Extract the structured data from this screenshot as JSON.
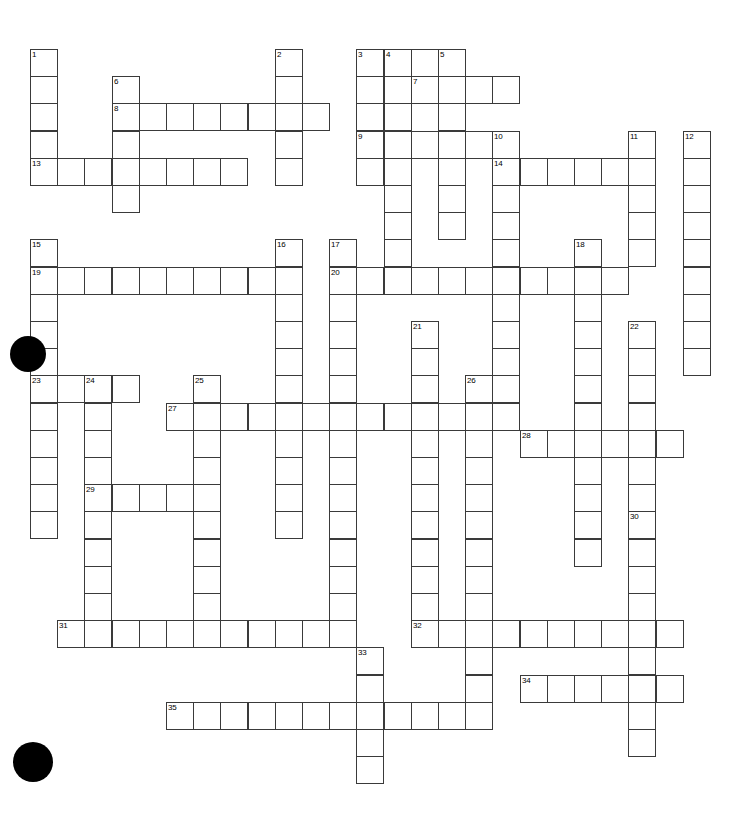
{
  "document": {
    "type": "crossword-puzzle-grid",
    "title": "Crossword Puzzle",
    "background_color": "#ffffff",
    "grid_line_color": "#3a3a3a",
    "cell_fill_color": "#ffffff",
    "marker_color": "#000000",
    "canvas": {
      "width": 738,
      "height": 814
    }
  },
  "grid": {
    "origin_x": 30,
    "origin_y": 49,
    "cell_size": 27.2,
    "columns": 25,
    "rows": 27,
    "number_count": 35
  },
  "markers": [
    {
      "name": "bullet-marker-left-middle",
      "cx": 28,
      "cy": 354,
      "r": 18
    },
    {
      "name": "bullet-marker-bottom-left",
      "cx": 33,
      "cy": 762,
      "r": 20
    }
  ],
  "entries": {
    "across": [
      {
        "number": 3,
        "col": 12,
        "row": 0,
        "length": 3
      },
      {
        "number": 7,
        "col": 14,
        "row": 1,
        "length": 4
      },
      {
        "number": 8,
        "col": 3,
        "row": 2,
        "length": 8
      },
      {
        "number": 9,
        "col": 12,
        "row": 3,
        "length": 6
      },
      {
        "number": 13,
        "col": 0,
        "row": 4,
        "length": 8
      },
      {
        "number": 14,
        "col": 17,
        "row": 4,
        "length": 6
      },
      {
        "number": 19,
        "col": 0,
        "row": 8,
        "length": 10
      },
      {
        "number": 20,
        "col": 11,
        "row": 8,
        "length": 11
      },
      {
        "number": 23,
        "col": 0,
        "row": 12,
        "length": 4
      },
      {
        "number": 27,
        "col": 5,
        "row": 13,
        "length": 13
      },
      {
        "number": 28,
        "col": 18,
        "row": 14,
        "length": 6
      },
      {
        "number": 29,
        "col": 2,
        "row": 16,
        "length": 4
      },
      {
        "number": 31,
        "col": 1,
        "row": 21,
        "length": 11
      },
      {
        "number": 32,
        "col": 14,
        "row": 21,
        "length": 10
      },
      {
        "number": 34,
        "col": 18,
        "row": 23,
        "length": 6
      },
      {
        "number": 35,
        "col": 5,
        "row": 24,
        "length": 11
      }
    ],
    "down": [
      {
        "number": 1,
        "col": 0,
        "row": 0,
        "length": 5
      },
      {
        "number": 2,
        "col": 9,
        "row": 0,
        "length": 5
      },
      {
        "number": 3,
        "col": 12,
        "row": 0,
        "length": 5
      },
      {
        "number": 4,
        "col": 13,
        "row": 0,
        "length": 9
      },
      {
        "number": 5,
        "col": 15,
        "row": 0,
        "length": 7
      },
      {
        "number": 6,
        "col": 3,
        "row": 1,
        "length": 5
      },
      {
        "number": 10,
        "col": 17,
        "row": 3,
        "length": 10
      },
      {
        "number": 11,
        "col": 22,
        "row": 3,
        "length": 5
      },
      {
        "number": 12,
        "col": 24,
        "row": 3,
        "length": 9
      },
      {
        "number": 15,
        "col": 0,
        "row": 7,
        "length": 11
      },
      {
        "number": 16,
        "col": 9,
        "row": 7,
        "length": 11
      },
      {
        "number": 17,
        "col": 11,
        "row": 7,
        "length": 15
      },
      {
        "number": 18,
        "col": 20,
        "row": 7,
        "length": 12
      },
      {
        "number": 21,
        "col": 14,
        "row": 10,
        "length": 12
      },
      {
        "number": 22,
        "col": 22,
        "row": 10,
        "length": 7
      },
      {
        "number": 24,
        "col": 2,
        "row": 12,
        "length": 10
      },
      {
        "number": 25,
        "col": 6,
        "row": 12,
        "length": 9
      },
      {
        "number": 26,
        "col": 16,
        "row": 12,
        "length": 13
      },
      {
        "number": 30,
        "col": 22,
        "row": 17,
        "length": 9
      },
      {
        "number": 33,
        "col": 12,
        "row": 22,
        "length": 5
      }
    ]
  }
}
